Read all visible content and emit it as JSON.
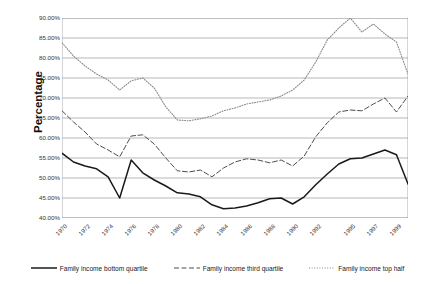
{
  "chart_data": {
    "type": "line",
    "title": "",
    "xlabel": "",
    "ylabel": "Percentage",
    "ylim": [
      40,
      90
    ],
    "ytick_step": 5,
    "ytick_labels": [
      "90.00%",
      "85.00%",
      "80.00%",
      "75.00%",
      "70.00%",
      "65.00%",
      "60.00%",
      "55.00%",
      "50.00%",
      "45.00%",
      "40.00%"
    ],
    "ytick_values": [
      90,
      85,
      80,
      75,
      70,
      65,
      60,
      55,
      50,
      45,
      40
    ],
    "xlim": [
      1970,
      2000
    ],
    "xtick_labels": [
      "1970",
      "1972",
      "1974",
      "1976",
      "1978",
      "1980",
      "1982",
      "1984",
      "1986",
      "1988",
      "1990",
      "1992",
      "1995",
      "1997",
      "1999"
    ],
    "xtick_values": [
      1970,
      1972,
      1974,
      1976,
      1978,
      1980,
      1982,
      1984,
      1986,
      1988,
      1990,
      1992,
      1995,
      1997,
      1999
    ],
    "grid": "horizontal",
    "legend_position": "bottom",
    "x": [
      1970,
      1971,
      1972,
      1973,
      1974,
      1975,
      1976,
      1977,
      1978,
      1979,
      1980,
      1981,
      1982,
      1983,
      1984,
      1985,
      1986,
      1987,
      1988,
      1989,
      1990,
      1991,
      1992,
      1993,
      1994,
      1995,
      1996,
      1997,
      1998,
      1999,
      2000
    ],
    "series": [
      {
        "name": "Family income bottom quartile",
        "style": "solid",
        "color": "#1a1a1a",
        "values": [
          56.2,
          54.0,
          53.0,
          52.3,
          50.3,
          45.0,
          54.5,
          51.3,
          49.5,
          48.0,
          46.3,
          46.0,
          45.3,
          43.3,
          42.3,
          42.5,
          43.0,
          43.8,
          44.8,
          45.0,
          43.5,
          45.3,
          48.3,
          51.0,
          53.5,
          54.8,
          55.0,
          56.0,
          57.0,
          55.8,
          48.5
        ]
      },
      {
        "name": "Family income third quartile",
        "style": "dashed",
        "color": "#4d4d4d",
        "values": [
          66.8,
          64.0,
          61.5,
          58.5,
          57.0,
          55.3,
          60.5,
          60.8,
          58.5,
          55.0,
          51.8,
          51.5,
          52.0,
          50.3,
          52.5,
          54.0,
          54.8,
          54.5,
          53.8,
          54.5,
          53.0,
          55.5,
          60.3,
          63.8,
          66.5,
          67.0,
          66.8,
          68.5,
          70.0,
          66.5,
          70.5
        ]
      },
      {
        "name": "Family income top half",
        "style": "dotted",
        "color": "#8a8a8a",
        "values": [
          83.8,
          80.5,
          78.0,
          76.0,
          74.5,
          72.0,
          74.3,
          75.0,
          72.5,
          67.8,
          64.5,
          64.3,
          64.8,
          65.5,
          66.8,
          67.5,
          68.5,
          69.0,
          69.5,
          70.5,
          72.0,
          74.5,
          79.0,
          84.5,
          87.5,
          90.0,
          86.5,
          88.5,
          86.0,
          84.0,
          76.0
        ]
      }
    ]
  },
  "legend": {
    "items": [
      {
        "label": "Family income bottom quartile",
        "style": "solid",
        "color": "#1a1a1a"
      },
      {
        "label": "Family income third quartile",
        "style": "dashed",
        "color": "#4d4d4d"
      },
      {
        "label": "Family income top half",
        "style": "dotted",
        "color": "#8a8a8a"
      }
    ]
  }
}
